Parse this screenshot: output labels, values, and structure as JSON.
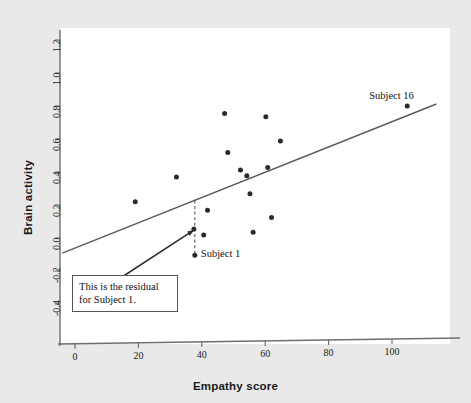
{
  "chart_data": {
    "type": "scatter",
    "title": "",
    "xlabel": "Empathy score",
    "ylabel": "Brain activity",
    "xlim": [
      -4,
      115
    ],
    "ylim": [
      -0.52,
      1.3
    ],
    "xticks": [
      0,
      20,
      40,
      60,
      80,
      100
    ],
    "xtick_labels": [
      "0",
      "20",
      "40",
      "60",
      "80",
      "100"
    ],
    "yticks": [
      -0.4,
      -0.2,
      0.0,
      0.2,
      0.4,
      0.6,
      0.8,
      1.0,
      1.2
    ],
    "ytick_labels": [
      "-0.4",
      "-0.2",
      "0.0",
      "0.2",
      "0.4",
      "0.6",
      "0.8",
      "1.0",
      "1.2"
    ],
    "grid": false,
    "legend": "none",
    "points": [
      {
        "x": 19,
        "y": 0.22,
        "label": ""
      },
      {
        "x": 32,
        "y": 0.37,
        "label": ""
      },
      {
        "x": 37.5,
        "y": 0.055,
        "label": ""
      },
      {
        "x": 37.8,
        "y": -0.105,
        "label": "Subject 1"
      },
      {
        "x": 41.8,
        "y": 0.168,
        "label": ""
      },
      {
        "x": 40.6,
        "y": 0.018,
        "label": ""
      },
      {
        "x": 47.2,
        "y": 0.755,
        "label": ""
      },
      {
        "x": 48.2,
        "y": 0.518,
        "label": ""
      },
      {
        "x": 52.2,
        "y": 0.412,
        "label": ""
      },
      {
        "x": 54.2,
        "y": 0.378,
        "label": ""
      },
      {
        "x": 55.2,
        "y": 0.268,
        "label": ""
      },
      {
        "x": 56.2,
        "y": 0.035,
        "label": ""
      },
      {
        "x": 60.2,
        "y": 0.735,
        "label": ""
      },
      {
        "x": 60.8,
        "y": 0.428,
        "label": ""
      },
      {
        "x": 62.0,
        "y": 0.125,
        "label": ""
      },
      {
        "x": 64.8,
        "y": 0.588,
        "label": ""
      },
      {
        "x": 104.8,
        "y": 0.8,
        "label": "Subject 16"
      }
    ],
    "regression_line": {
      "x_start": -4,
      "y_start": -0.092,
      "x_end": 114,
      "y_end": 0.812
    },
    "residual_marker": {
      "x": 37.8,
      "y_point": -0.105,
      "y_line": 0.228
    },
    "point_color": "#2b2b2b",
    "line_color": "#5a5a5a",
    "axis_color": "#6e6e6e",
    "text_color": "#111111",
    "plot_bg": "#ffffff",
    "page_bg": "#e9e9e9"
  },
  "annotations": {
    "callout_line1": "This is the residual",
    "callout_line2": "for Subject 1.",
    "subject1_label": "Subject 1",
    "subject16_label": "Subject 16"
  }
}
